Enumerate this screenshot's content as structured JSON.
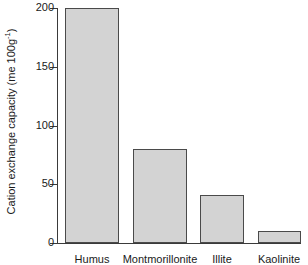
{
  "chart_data": {
    "type": "bar",
    "title": "",
    "xlabel": "",
    "ylabel": "Cation exchange capacity (me 100g",
    "ylabel_sup": "-1",
    "ylabel_suffix": ")",
    "ylabel_full": "Cation exchange capacity (me 100g-1)",
    "categories": [
      "Humus",
      "Montmorillonite",
      "Illite",
      "Kaolinite"
    ],
    "values": [
      200,
      80,
      41,
      10
    ],
    "ylim": [
      0,
      200
    ],
    "yticks": [
      0,
      50,
      100,
      150,
      200
    ],
    "ytick_labels": [
      "0",
      "50",
      "100",
      "150",
      "200"
    ],
    "grid": false,
    "legend": false,
    "bar_fill_color": "#d3d3d3",
    "bar_edge_color": "#4a4a4a",
    "axis_color": "#3a3a3a",
    "background_color": "#ffffff"
  }
}
